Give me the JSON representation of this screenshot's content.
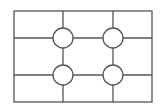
{
  "diagram": {
    "type": "rule-of-thirds-grid",
    "stroke_color": "#555555",
    "background": "#ffffff",
    "frame": {
      "x": 14,
      "y": 11,
      "width": 138,
      "height": 91
    },
    "vertical_lines_x": [
      63,
      113
    ],
    "horizontal_lines_y": [
      38,
      75
    ],
    "intersections": [
      {
        "cx": 63,
        "cy": 38,
        "r": 10
      },
      {
        "cx": 113,
        "cy": 38,
        "r": 10
      },
      {
        "cx": 63,
        "cy": 75,
        "r": 10
      },
      {
        "cx": 113,
        "cy": 75,
        "r": 10
      }
    ]
  }
}
